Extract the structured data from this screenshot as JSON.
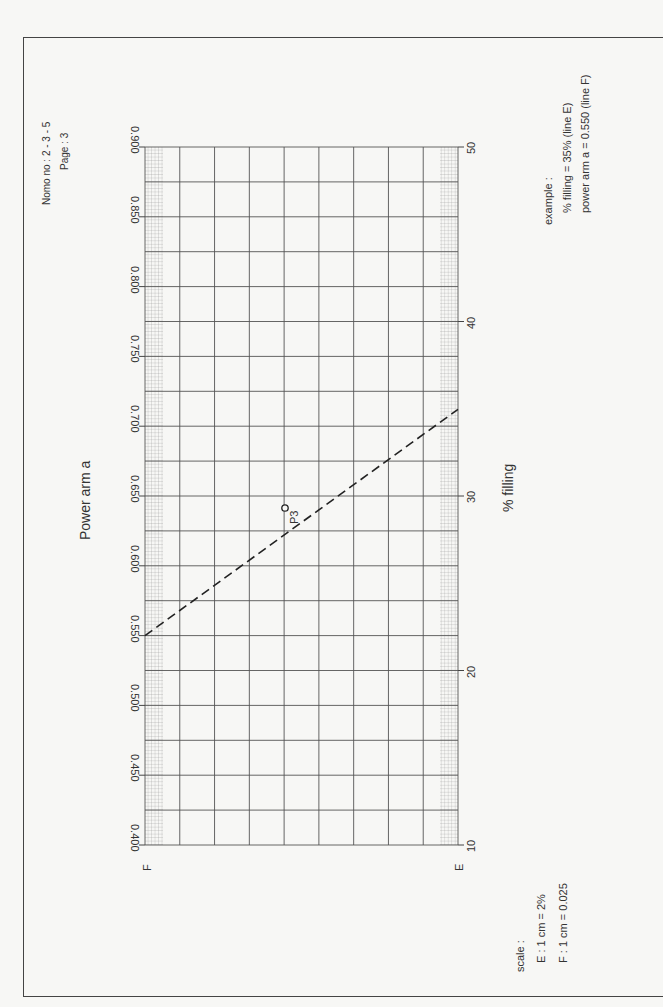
{
  "header": {
    "nomo_label": "Nomo no : 2 - 3 - 5",
    "page_label": "Page     : 3"
  },
  "example": {
    "title": "example :",
    "line1": "% filling = 35% (line E)",
    "line2": "power arm a = 0.550 (line F)"
  },
  "scale": {
    "title": "scale :",
    "line1": "E : 1 cm = 2%",
    "line2": "F : 1 cm = 0.025"
  },
  "axes": {
    "F": {
      "letter": "F",
      "title": "Power arm a",
      "ticks": [
        "0.400",
        "0.450",
        "0.500",
        "0.550",
        "0.600",
        "0.650",
        "0.700",
        "0.750",
        "0.800",
        "0.850",
        "0.900"
      ]
    },
    "E": {
      "letter": "E",
      "title": "% filling",
      "ticks": [
        "10",
        "20",
        "30",
        "40",
        "50"
      ]
    }
  },
  "point": {
    "label": "P3"
  },
  "colors": {
    "grid": "#555555",
    "minor": "#888888",
    "line": "#222222",
    "text": "#333333"
  },
  "chart_data": {
    "type": "line",
    "xlabel": "% filling",
    "ylabel": "Power arm a",
    "axes": [
      {
        "name": "E",
        "label": "% filling",
        "range": [
          10,
          50
        ],
        "ticks": [
          10,
          20,
          30,
          40,
          50
        ],
        "scale": "1 cm = 2%"
      },
      {
        "name": "F",
        "label": "Power arm a",
        "range": [
          0.4,
          0.9
        ],
        "ticks": [
          0.4,
          0.45,
          0.5,
          0.55,
          0.6,
          0.65,
          0.7,
          0.75,
          0.8,
          0.85,
          0.9
        ],
        "scale": "1 cm = 0.025"
      }
    ],
    "series": [
      {
        "name": "example isopleth (dashed)",
        "from": {
          "axis": "F",
          "value": 0.55
        },
        "to": {
          "axis": "E",
          "value": 35
        }
      }
    ],
    "points": [
      {
        "label": "P3",
        "pivot": true
      }
    ],
    "annotations": [
      "example : % filling = 35% (line E)",
      "power arm a = 0.550 (line F)"
    ],
    "grid": true
  }
}
